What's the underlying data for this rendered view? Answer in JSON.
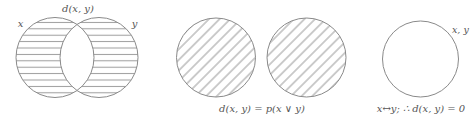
{
  "colors": {
    "stroke": "#8a8a8a",
    "hatch": "#9a9a9a",
    "text": "#555555",
    "background": "#ffffff"
  },
  "diagrams": [
    {
      "id": "symmetric-difference",
      "title": "d(x, y)",
      "set_labels": [
        "x",
        "y"
      ],
      "shading": "horizontal-lines",
      "shaded_region": "x XOR y (intersection unshaded)",
      "caption": ""
    },
    {
      "id": "disjoint-sets",
      "title": "",
      "set_labels": [],
      "shading": "diagonal-lines",
      "shaded_region": "both circles fully",
      "caption": "d(x, y) = p(x ∨ y)"
    },
    {
      "id": "equal-sets",
      "title": "",
      "set_labels": [
        "x, y"
      ],
      "shading": "none",
      "shaded_region": "none",
      "caption": "x↔y; ∴ d(x, y) = 0"
    }
  ]
}
